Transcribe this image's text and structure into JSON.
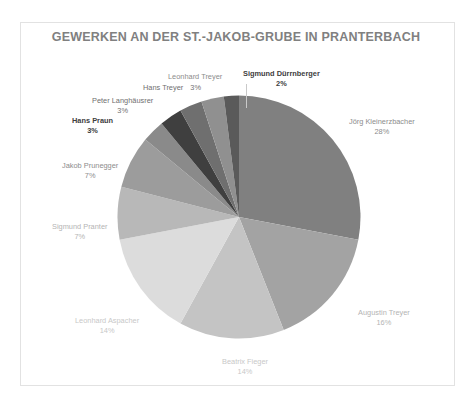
{
  "frame": {
    "border_color": "#e2e2e2"
  },
  "chart_data": {
    "type": "pie",
    "title": "GEWERKEN AN DER ST.-JAKOB-GRUBE IN PRANTERBACH",
    "xlabel": "",
    "ylabel": "",
    "legend": "none",
    "grid": false,
    "start_angle_deg": 0,
    "direction": "clockwise",
    "categories": [
      "Jörg Kleinerzbacher",
      "Augustin Treyer",
      "Beatrix Fieger",
      "Leonhard Aspacher",
      "Sigmund Pranter",
      "Jakob Prunegger",
      "Hans Praun",
      "Peter Langhäusrer",
      "Hans Treyer",
      "Leonhard Treyer",
      "Sigmund Dürrnberger"
    ],
    "values": [
      28,
      16,
      14,
      14,
      7,
      7,
      3,
      3,
      3,
      3,
      2
    ],
    "value_labels": [
      "28%",
      "16%",
      "14%",
      "14%",
      "7%",
      "7%",
      "3%",
      "3%",
      "3%",
      "3%",
      "2%"
    ],
    "colors": [
      "#7f7f7f",
      "#a6a6a6",
      "#bfbfbf",
      "#d9d9d9",
      "#cfcfcf",
      "#9a9a9a",
      "#8c8c8c",
      "#404040",
      "#737373",
      "#8a8a8a",
      "#b2b2b2",
      "#595959",
      "#a0a0a0"
    ]
  },
  "slices": [
    {
      "name": "Jörg Kleinerzbacher",
      "pct": "28%",
      "color": "#808080"
    },
    {
      "name": "Augustin Treyer",
      "pct": "16%",
      "color": "#a3a3a3"
    },
    {
      "name": "Beatrix Fieger",
      "pct": "14%",
      "color": "#c4c4c4"
    },
    {
      "name": "Leonhard Aspacher",
      "pct": "14%",
      "color": "#dcdcdc"
    },
    {
      "name": "Sigmund Pranter",
      "pct": "7%",
      "color": "#b8b8b8"
    },
    {
      "name": "Jakob Prunegger",
      "pct": "7%",
      "color": "#9c9c9c"
    },
    {
      "name": "Hans Praun",
      "pct": "3%",
      "color": "#8a8a8a"
    },
    {
      "name": "Peter Langhäusrer",
      "pct": "3%",
      "color": "#3f3f3f"
    },
    {
      "name": "Hans Treyer",
      "pct": "3%",
      "color": "#6f6f6f"
    },
    {
      "name": "Leonhard Treyer",
      "pct": "3%",
      "color": "#909090"
    },
    {
      "name": "Sigmund Dürrnberger",
      "pct": "2%",
      "color": "#5a5a5a"
    }
  ],
  "labels": {
    "joerg_name": "Jörg Kleinerzbacher",
    "joerg_pct": "28%",
    "augustin_name": "Augustin Treyer",
    "augustin_pct": "16%",
    "beatrix_name": "Beatrix Fieger",
    "beatrix_pct": "14%",
    "aspacher_name": "Leonhard Aspacher",
    "aspacher_pct": "14%",
    "pranter_name": "Sigmund Pranter",
    "pranter_pct": "7%",
    "prunegger_name": "Jakob Prunegger",
    "prunegger_pct": "7%",
    "praun_name": "Hans Praun",
    "praun_pct": "3%",
    "langhaeusrer_name": "Peter Langhäusrer",
    "langhaeusrer_pct": "3%",
    "hans_treyer_name": "Hans Treyer",
    "hans_treyer_pct": "3%",
    "leonhard_treyer_name": "Leonhard Treyer",
    "leonhard_treyer_pct": "3%",
    "duerrnberger_name": "Sigmund Dürrnberger",
    "duerrnberger_pct": "2%"
  },
  "label_colors": {
    "dark": "#404040",
    "mid": "#8c8c8c",
    "light": "#b4b4b4",
    "lighter": "#c8c8c8",
    "title": "#808080"
  }
}
